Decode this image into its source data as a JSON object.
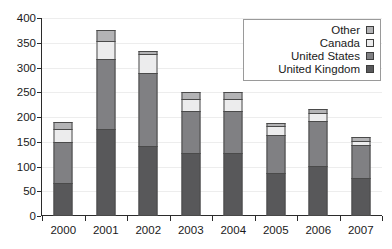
{
  "chart_data": {
    "type": "bar",
    "stacked": true,
    "title": "",
    "subtitle": "",
    "xlabel": "",
    "ylabel": "",
    "categories": [
      "2000",
      "2001",
      "2002",
      "2003",
      "2004",
      "2005",
      "2006",
      "2007"
    ],
    "series": [
      {
        "name": "United Kingdom",
        "color": "#58585a",
        "values": [
          67,
          175,
          141,
          127,
          127,
          87,
          102,
          77
        ]
      },
      {
        "name": "United States",
        "color": "#808083",
        "values": [
          84,
          145,
          150,
          88,
          87,
          78,
          92,
          68
        ]
      },
      {
        "name": "Canada",
        "color": "#ececed",
        "values": [
          29,
          37,
          40,
          26,
          26,
          20,
          18,
          10
        ]
      },
      {
        "name": "Other",
        "color": "#b3b3b5",
        "values": [
          17,
          24,
          9,
          16,
          16,
          8,
          11,
          10
        ]
      }
    ],
    "totals": [
      197,
      381,
      340,
      257,
      256,
      193,
      223,
      165
    ],
    "ylim": [
      0,
      400
    ],
    "yticks": [
      0,
      50,
      100,
      150,
      200,
      250,
      300,
      350,
      400
    ],
    "ytick_labels": [
      "0",
      "50",
      "100",
      "150",
      "200",
      "250",
      "300",
      "350",
      "400"
    ],
    "grid": true,
    "legend_position": "top-right",
    "legend_entries": [
      "Other",
      "Canada",
      "United States",
      "United Kingdom"
    ]
  },
  "legend": {
    "items": [
      {
        "label": "Other",
        "color": "#b3b3b5"
      },
      {
        "label": "Canada",
        "color": "#ececed"
      },
      {
        "label": "United States",
        "color": "#808083"
      },
      {
        "label": "United Kingdom",
        "color": "#58585a"
      }
    ]
  },
  "axes": {
    "y_tick_labels": [
      "400",
      "350",
      "300",
      "250",
      "200",
      "150",
      "100",
      "50",
      "0"
    ],
    "x_tick_labels": [
      "2000",
      "2001",
      "2002",
      "2003",
      "2004",
      "2005",
      "2006",
      "2007"
    ]
  }
}
